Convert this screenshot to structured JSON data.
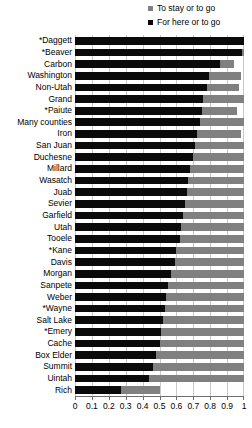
{
  "chart_data": {
    "type": "bar",
    "orientation": "horizontal",
    "title": "",
    "xlabel": "",
    "ylabel": "",
    "xlim": [
      0,
      1
    ],
    "ylim": null,
    "grid": true,
    "legend_position": "top-right",
    "xticks": [
      0,
      0.1,
      0.2,
      0.3,
      0.4,
      0.5,
      0.6,
      0.7,
      0.8,
      0.9,
      1
    ],
    "xticklabels": [
      "0",
      "0.1",
      "0.2",
      "0.3",
      "0.4",
      "0.5",
      "0.6",
      "0.7",
      "0.8",
      "0.9",
      "1"
    ],
    "categories": [
      "*Daggett",
      "*Beaver",
      "Carbon",
      "Washington",
      "Non-Utah",
      "Grand",
      "*Paiute",
      "Many counties",
      "Iron",
      "San Juan",
      "Duchesne",
      "Millard",
      "Wasatch",
      "Juab",
      "Sevier",
      "Garfield",
      "Utah",
      "Tooele",
      "*Kane",
      "Davis",
      "Morgan",
      "Sanpete",
      "Weber",
      "*Wayne",
      "Salt Lake",
      "*Emery",
      "Cache",
      "Box Elder",
      "Summit",
      "Uintah",
      "Rich"
    ],
    "series": [
      {
        "name": "To stay or to go",
        "color": "#808080",
        "values": [
          1.0,
          1.0,
          0.94,
          0.98,
          0.97,
          1.0,
          0.96,
          1.0,
          0.98,
          1.0,
          1.0,
          1.0,
          1.0,
          1.0,
          1.0,
          1.0,
          1.0,
          1.0,
          1.0,
          1.0,
          1.0,
          1.0,
          1.0,
          1.0,
          1.0,
          1.0,
          1.0,
          1.0,
          1.0,
          1.0,
          0.5
        ]
      },
      {
        "name": "For here or to go",
        "color": "#0a0a0a",
        "values": [
          1.0,
          0.99,
          0.86,
          0.79,
          0.78,
          0.76,
          0.75,
          0.74,
          0.72,
          0.71,
          0.7,
          0.68,
          0.67,
          0.66,
          0.65,
          0.64,
          0.63,
          0.62,
          0.6,
          0.59,
          0.57,
          0.55,
          0.54,
          0.53,
          0.52,
          0.51,
          0.5,
          0.48,
          0.46,
          0.44,
          0.27
        ]
      }
    ]
  },
  "legend": {
    "items": [
      {
        "label": "To stay or to go",
        "color": "#808080"
      },
      {
        "label": "For here or to go",
        "color": "#0a0a0a"
      }
    ]
  }
}
